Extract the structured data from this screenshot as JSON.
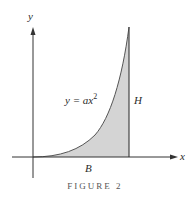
{
  "figure": {
    "caption": "FIGURE 2",
    "axes": {
      "x_label": "x",
      "y_label": "y"
    },
    "curve_label": "y = ax",
    "curve_exponent": "2",
    "base_label": "B",
    "height_label": "H"
  },
  "colors": {
    "fill": "#d4d4d4",
    "stroke": "#3a3a3a"
  }
}
